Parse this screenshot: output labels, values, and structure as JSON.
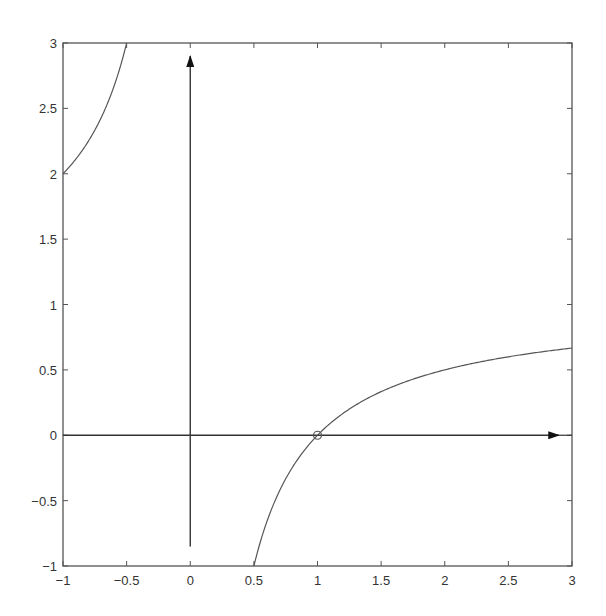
{
  "chart_data": {
    "type": "line",
    "title": "",
    "xlabel": "",
    "ylabel": "",
    "xlim": [
      -1,
      3
    ],
    "ylim": [
      -1,
      3
    ],
    "grid": false,
    "legend": null,
    "x_ticks": [
      -1,
      -0.5,
      0,
      0.5,
      1,
      1.5,
      2,
      2.5,
      3
    ],
    "x_tick_labels": [
      "-1",
      "-0.5",
      "0",
      "0.5",
      "1",
      "1.5",
      "2",
      "2.5",
      "3"
    ],
    "y_ticks": [
      -1,
      -0.5,
      0,
      0.5,
      1,
      1.5,
      2,
      2.5,
      3
    ],
    "y_tick_labels": [
      "-1",
      "-0.5",
      "0",
      "0.5",
      "1",
      "1.5",
      "2",
      "2.5",
      "3"
    ],
    "series": [
      {
        "name": "f(x) = 1 - 1/x (left branch)",
        "x": [
          -1,
          -0.9,
          -0.8,
          -0.7,
          -0.6,
          -0.5
        ],
        "y": [
          2,
          2.111,
          2.25,
          2.429,
          2.667,
          3
        ]
      },
      {
        "name": "f(x) = 1 - 1/x (right branch)",
        "x": [
          0.5,
          0.6,
          0.7,
          0.8,
          0.9,
          1,
          1.25,
          1.5,
          1.75,
          2,
          2.25,
          2.5,
          2.75,
          3
        ],
        "y": [
          -1,
          -0.667,
          -0.429,
          -0.25,
          -0.111,
          0,
          0.2,
          0.333,
          0.429,
          0.5,
          0.556,
          0.6,
          0.636,
          0.667
        ]
      }
    ],
    "annotations": [
      {
        "type": "arrow",
        "label": "x-axis arrow",
        "from": [
          -1,
          0
        ],
        "to": [
          2.9,
          0
        ]
      },
      {
        "type": "arrow",
        "label": "y-axis arrow",
        "from": [
          0,
          -0.85
        ],
        "to": [
          0,
          2.9
        ]
      },
      {
        "type": "open-circle-marker",
        "label": "root",
        "at": [
          1,
          0
        ]
      }
    ]
  },
  "colors": {
    "curve": "#555555",
    "axes": "#333333",
    "frame": "#555555"
  }
}
